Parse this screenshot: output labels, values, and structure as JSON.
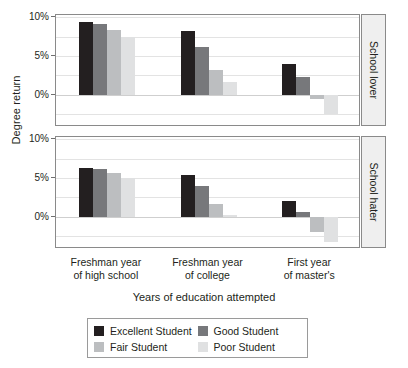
{
  "chart_data": {
    "type": "bar",
    "title": "",
    "xlabel": "Years of education attempted",
    "ylabel": "Degree return",
    "categories": [
      "Freshman year of high school",
      "Freshman year of college",
      "First year of master's"
    ],
    "category_lines": [
      [
        "Freshman year",
        "of high school"
      ],
      [
        "Freshman year",
        "of college"
      ],
      [
        "First year",
        "of master's"
      ]
    ],
    "ylim": [
      -3.9,
      10.3
    ],
    "yticks": [
      10,
      5,
      0
    ],
    "ytick_labels": [
      "10%",
      "5%",
      "0%"
    ],
    "grid": true,
    "legend_position": "bottom",
    "series_names": [
      "Excellent Student",
      "Good Student",
      "Fair Student",
      "Poor Student"
    ],
    "series_colors": [
      "#231f20",
      "#77787b",
      "#bcbec0",
      "#e0e1e2"
    ],
    "panels": [
      {
        "strip_label": "School lover",
        "series": [
          {
            "name": "Excellent Student",
            "values": [
              9.4,
              8.2,
              4.0
            ]
          },
          {
            "name": "Good Student",
            "values": [
              9.1,
              6.2,
              2.3
            ]
          },
          {
            "name": "Fair Student",
            "values": [
              8.4,
              3.2,
              -0.6
            ]
          },
          {
            "name": "Poor Student",
            "values": [
              7.4,
              1.7,
              -2.5
            ]
          }
        ]
      },
      {
        "strip_label": "School hater",
        "series": [
          {
            "name": "Excellent Student",
            "values": [
              6.3,
              5.4,
              2.0
            ]
          },
          {
            "name": "Good Student",
            "values": [
              6.2,
              4.0,
              0.6
            ]
          },
          {
            "name": "Fair Student",
            "values": [
              5.6,
              1.6,
              -2.0
            ]
          },
          {
            "name": "Poor Student",
            "values": [
              5.0,
              0.2,
              -3.3
            ]
          }
        ]
      }
    ]
  },
  "axis": {
    "y_title": "Degree return",
    "x_title": "Years of education attempted",
    "y_tick_labels": [
      "10%",
      "5%",
      "0%"
    ]
  },
  "panels": {
    "top_strip": "School lover",
    "bottom_strip": "School hater"
  },
  "legend": {
    "items": [
      {
        "label": "Excellent Student",
        "color": "#231f20"
      },
      {
        "label": "Good Student",
        "color": "#77787b"
      },
      {
        "label": "Fair Student",
        "color": "#bcbec0"
      },
      {
        "label": "Poor Student",
        "color": "#e0e1e2"
      }
    ]
  }
}
